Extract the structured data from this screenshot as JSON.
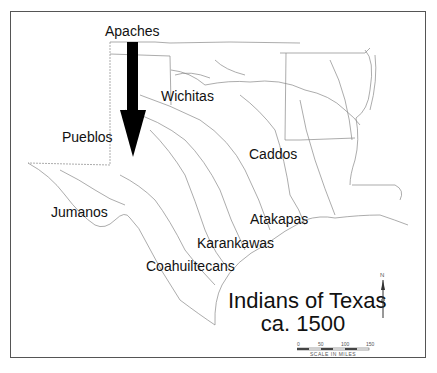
{
  "map": {
    "title_line1": "Indians of Texas",
    "title_line2": "ca. 1500",
    "labels": {
      "apaches": "Apaches",
      "wichitas": "Wichitas",
      "pueblos": "Pueblos",
      "caddos": "Caddos",
      "jumanos": "Jumanos",
      "atakapas": "Atakapas",
      "karankawas": "Karankawas",
      "coahuiltecans": "Coahuiltecans"
    },
    "north_arrow": "N",
    "scale": {
      "ticks": [
        "0",
        "50",
        "100",
        "150"
      ],
      "label": "SCALE IN MILES"
    },
    "arrow": {
      "direction": "south",
      "color": "#000000"
    }
  }
}
